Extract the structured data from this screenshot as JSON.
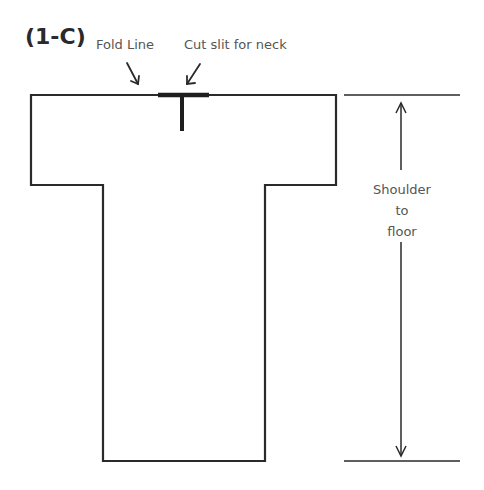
{
  "figure": {
    "title": "(1-C)",
    "labels": {
      "fold_line": "Fold Line",
      "neck_slit": "Cut slit for neck"
    },
    "measurement": {
      "line1": "Shoulder",
      "line2": "to",
      "line3": "floor"
    },
    "colors": {
      "outline": "#2a2a2a",
      "text": "#555555",
      "background": "#ffffff"
    }
  }
}
